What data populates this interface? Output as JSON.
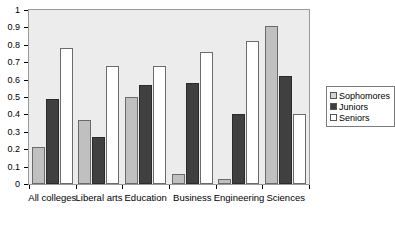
{
  "chart_data": {
    "type": "bar",
    "title": "",
    "subtitle": "",
    "xlabel": "",
    "ylabel": "",
    "ylim": [
      0,
      1
    ],
    "ytick_labels": [
      "0",
      "0.1",
      "0.2",
      "0.3",
      "0.4",
      "0.5",
      "0.6",
      "0.7",
      "0.8",
      "0.9",
      "1"
    ],
    "ytick_values": [
      0,
      0.1,
      0.2,
      0.3,
      0.4,
      0.5,
      0.6,
      0.7,
      0.8,
      0.9,
      1
    ],
    "grid": false,
    "legend_position": "right",
    "categories": [
      "All colleges",
      "Liberal arts",
      "Education",
      "Business",
      "Engineering",
      "Sciences"
    ],
    "series": [
      {
        "name": "Sophomores",
        "color": "#c0c0c0",
        "values": [
          0.21,
          0.37,
          0.5,
          0.06,
          0.03,
          0.91
        ]
      },
      {
        "name": "Juniors",
        "color": "#404040",
        "values": [
          0.49,
          0.27,
          0.57,
          0.58,
          0.4,
          0.62
        ]
      },
      {
        "name": "Seniors",
        "color": "#ffffff",
        "values": [
          0.78,
          0.68,
          0.68,
          0.76,
          0.82,
          0.4
        ]
      }
    ]
  },
  "legend": {
    "entries": [
      {
        "label": "Sophomores",
        "swatch": "legend-swatch-sophomores"
      },
      {
        "label": "Juniors",
        "swatch": "legend-swatch-juniors"
      },
      {
        "label": "Seniors",
        "swatch": "legend-swatch-seniors"
      }
    ]
  },
  "plot": {
    "background_color": "#ececec",
    "border_color": "#9a9a9a"
  }
}
